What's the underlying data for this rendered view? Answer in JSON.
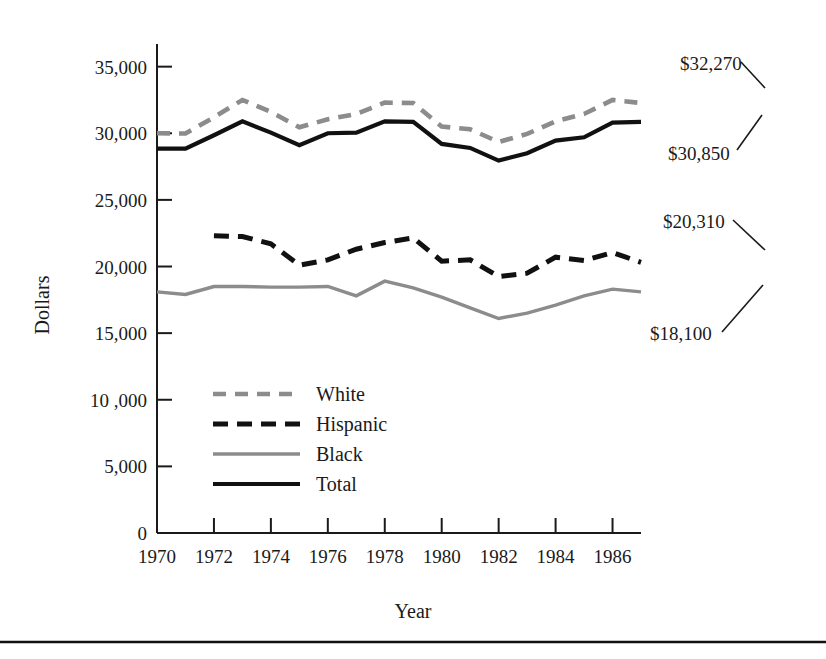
{
  "chart_data": {
    "type": "line",
    "title": "",
    "xlabel": "Year",
    "ylabel": "Dollars",
    "xlim": [
      1970,
      1987
    ],
    "ylim": [
      0,
      36700
    ],
    "grid": false,
    "legend_position": "inside-lower-left",
    "x_tick_labels": [
      "1970",
      "1972",
      "1974",
      "1976",
      "1978",
      "1980",
      "1982",
      "1984",
      "1986"
    ],
    "x_ticks": [
      1970,
      1972,
      1974,
      1976,
      1978,
      1980,
      1982,
      1984,
      1986
    ],
    "y_tick_labels": [
      "0",
      "5,000",
      "10 ,000",
      "15,000",
      "20,000",
      "25,000",
      "30,000",
      "35,000"
    ],
    "y_ticks": [
      0,
      5000,
      10000,
      15000,
      20000,
      25000,
      30000,
      35000
    ],
    "x": [
      1970,
      1971,
      1972,
      1973,
      1974,
      1975,
      1976,
      1977,
      1978,
      1979,
      1980,
      1981,
      1982,
      1983,
      1984,
      1985,
      1986,
      1987
    ],
    "series": [
      {
        "name": "White",
        "style": "dashed",
        "color": "#8c8c8c",
        "x": [
          1970,
          1971,
          1972,
          1973,
          1974,
          1975,
          1976,
          1977,
          1978,
          1979,
          1980,
          1981,
          1982,
          1983,
          1984,
          1985,
          1986,
          1987
        ],
        "values": [
          30000,
          29980,
          31200,
          32500,
          31600,
          30450,
          31050,
          31450,
          32300,
          32270,
          30500,
          30300,
          29350,
          29950,
          30900,
          31450,
          32500,
          32270
        ]
      },
      {
        "name": "Hispanic",
        "style": "dashed",
        "color": "#111111",
        "x": [
          1972,
          1973,
          1974,
          1975,
          1976,
          1977,
          1978,
          1979,
          1980,
          1981,
          1982,
          1983,
          1984,
          1985,
          1986,
          1987
        ],
        "values": [
          22300,
          22250,
          21700,
          20100,
          20500,
          21300,
          21800,
          22150,
          20400,
          20500,
          19250,
          19500,
          20700,
          20450,
          21050,
          20310
        ]
      },
      {
        "name": "Black",
        "style": "solid",
        "color": "#8c8c8c",
        "x": [
          1970,
          1971,
          1972,
          1973,
          1974,
          1975,
          1976,
          1977,
          1978,
          1979,
          1980,
          1981,
          1982,
          1983,
          1984,
          1985,
          1986,
          1987
        ],
        "values": [
          18100,
          17900,
          18500,
          18500,
          18450,
          18450,
          18500,
          17800,
          18900,
          18400,
          17700,
          16900,
          16100,
          16500,
          17100,
          17800,
          18300,
          18100
        ]
      },
      {
        "name": "Total",
        "style": "solid",
        "color": "#111111",
        "x": [
          1970,
          1971,
          1972,
          1973,
          1974,
          1975,
          1976,
          1977,
          1978,
          1979,
          1980,
          1981,
          1982,
          1983,
          1984,
          1985,
          1986,
          1987
        ],
        "values": [
          28850,
          28850,
          29850,
          30900,
          30050,
          29100,
          30000,
          30050,
          30900,
          30850,
          29200,
          28900,
          27950,
          28500,
          29450,
          29700,
          30800,
          30850
        ]
      }
    ],
    "annotations": [
      {
        "label": "$32,270",
        "series": "White",
        "value": 32270,
        "year": 1987
      },
      {
        "label": "$30,850",
        "series": "Total",
        "value": 30850,
        "year": 1987
      },
      {
        "label": "$20,310",
        "series": "Hispanic",
        "value": 20310,
        "year": 1987
      },
      {
        "label": "$18,100",
        "series": "Black",
        "value": 18100,
        "year": 1987
      }
    ]
  },
  "legend": {
    "items": [
      {
        "label": "White"
      },
      {
        "label": "Hispanic"
      },
      {
        "label": "Black"
      },
      {
        "label": "Total"
      }
    ]
  },
  "axis": {
    "y_title": "Dollars",
    "x_title": "Year"
  },
  "annotation_labels": {
    "white": "$32,270",
    "total": "$30,850",
    "hispanic": "$20,310",
    "black": "$18,100"
  }
}
